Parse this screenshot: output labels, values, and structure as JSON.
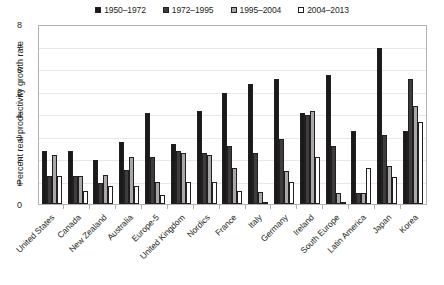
{
  "chart_data": {
    "type": "bar",
    "title": "",
    "xlabel": "",
    "ylabel": "Percent real productivity growth rate",
    "ylim": [
      0,
      8
    ],
    "yticks": [
      0,
      1,
      2,
      3,
      4,
      5,
      6,
      7,
      8
    ],
    "grid": true,
    "legend_position": "top",
    "categories": [
      "United States",
      "Canada",
      "New Zealand",
      "Australia",
      "Europe-5",
      "United Kingdom",
      "Nordics",
      "France",
      "Italy",
      "Germany",
      "Ireland",
      "South Europe",
      "Latin America",
      "Japan",
      "Korea"
    ],
    "series": [
      {
        "name": "1950–1972",
        "color": "#1a1a1a",
        "values": [
          2.4,
          2.4,
          2.0,
          2.8,
          4.1,
          2.7,
          4.2,
          5.0,
          5.4,
          5.6,
          4.1,
          5.8,
          3.3,
          7.0,
          3.3
        ]
      },
      {
        "name": "1972–1995",
        "color": "#3d3d3d",
        "values": [
          1.25,
          1.25,
          0.95,
          1.55,
          2.1,
          2.4,
          2.3,
          2.6,
          2.3,
          2.9,
          4.0,
          2.6,
          0.5,
          3.1,
          5.6
        ]
      },
      {
        "name": "1995–2004",
        "color": "#a8a8a8",
        "values": [
          2.2,
          1.25,
          1.3,
          2.1,
          1.0,
          2.3,
          2.2,
          1.6,
          0.55,
          1.5,
          4.2,
          0.5,
          0.5,
          1.7,
          4.4
        ]
      },
      {
        "name": "2004–2013",
        "color": "#ffffff",
        "values": [
          1.25,
          0.6,
          0.8,
          0.8,
          0.4,
          1.0,
          1.0,
          0.6,
          0.1,
          1.0,
          2.1,
          0.1,
          1.6,
          1.2,
          3.7
        ]
      }
    ]
  }
}
